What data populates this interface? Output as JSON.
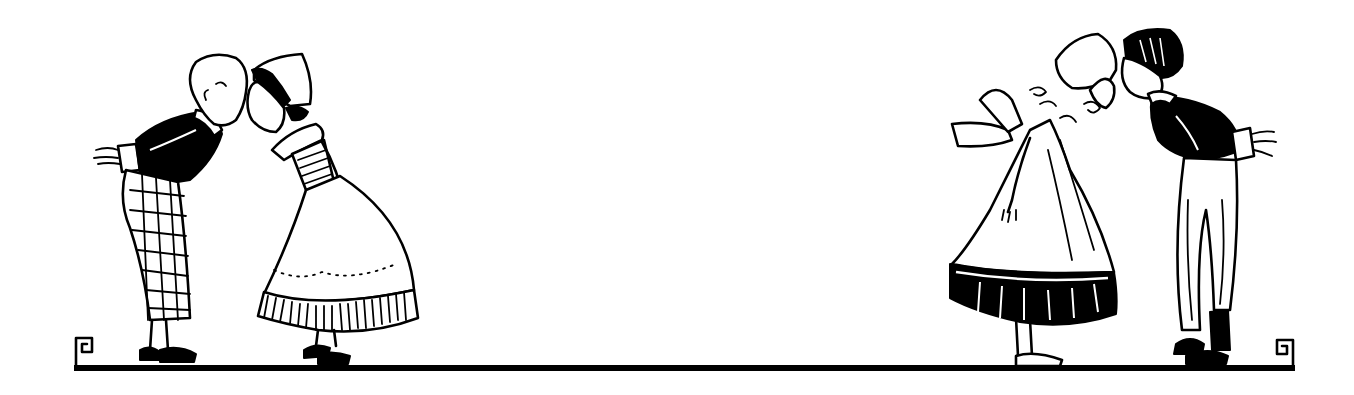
{
  "illustration": {
    "style": "black-and-white vintage line art",
    "background_color": "#ffffff",
    "ink_color": "#000000",
    "scenes": [
      {
        "name": "left-couple",
        "figures": [
          {
            "role": "boy",
            "position": "left",
            "facing": "right",
            "details": [
              "curly hair",
              "black jacket with white collar",
              "checkered trousers",
              "hands behind back",
              "black shoes"
            ]
          },
          {
            "role": "girl",
            "position": "right",
            "facing": "left",
            "details": [
              "Dutch bonnet",
              "striped bodice",
              "white apron with dotted hem",
              "striped petticoat",
              "black shoes"
            ]
          }
        ],
        "action": "kissing"
      },
      {
        "name": "right-couple",
        "figures": [
          {
            "role": "girl",
            "position": "left",
            "facing": "right",
            "details": [
              "Dutch bonnet",
              "curly hair",
              "large apron bow",
              "white apron",
              "black striped skirt hem"
            ]
          },
          {
            "role": "boy",
            "position": "right",
            "facing": "left",
            "details": [
              "dark wavy hair",
              "black jacket",
              "white trousers",
              "hands behind back",
              "black shoes"
            ]
          }
        ],
        "action": "kissing"
      }
    ],
    "baseline": {
      "x_start": 74,
      "x_end": 1294,
      "y": 368,
      "thickness": 5,
      "end_ornament": "square-spiral scroll"
    }
  }
}
